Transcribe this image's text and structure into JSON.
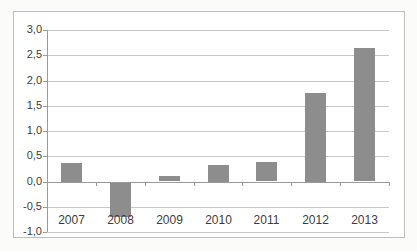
{
  "chart_data": {
    "type": "bar",
    "categories": [
      "2007",
      "2008",
      "2009",
      "2010",
      "2011",
      "2012",
      "2013"
    ],
    "values": [
      0.37,
      -0.7,
      0.1,
      0.33,
      0.38,
      1.76,
      2.64
    ],
    "series_count": 1,
    "ylim": [
      -1.0,
      3.0
    ],
    "ytick_step": 0.5,
    "yticks": [
      {
        "value": 3.0,
        "label": "3,0"
      },
      {
        "value": 2.5,
        "label": "2,5"
      },
      {
        "value": 2.0,
        "label": "2,0"
      },
      {
        "value": 1.5,
        "label": "1,5"
      },
      {
        "value": 1.0,
        "label": "1,0"
      },
      {
        "value": 0.5,
        "label": "0,5"
      },
      {
        "value": 0.0,
        "label": "0,0"
      },
      {
        "value": -0.5,
        "label": "-0,5"
      },
      {
        "value": -1.0,
        "label": "-1,0"
      }
    ],
    "decimal_separator": ",",
    "grid": true,
    "legend": false,
    "colors": {
      "bar_fill": "#8d8d8d",
      "gridline": "#c8c8c8",
      "axis_line": "#9a9a9a",
      "frame_border": "#bdbdbd",
      "plot_background": "#ffffff",
      "text": "#3d3d3d"
    }
  }
}
